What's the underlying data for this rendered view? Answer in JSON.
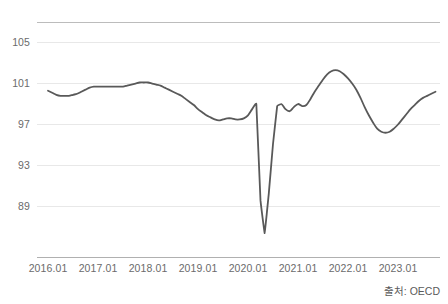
{
  "source_note": "출처: OECD",
  "chart_data": {
    "type": "line",
    "title": "",
    "subtitle": "",
    "xlabel": "",
    "ylabel": "",
    "grid": true,
    "legend": "none",
    "legend_entries": [],
    "line_color": "#595959",
    "gridline_color": "#e8e8e8",
    "axis_color": "#b0b0b0",
    "ylim": [
      85.2,
      106.9
    ],
    "yticks": [
      89,
      93,
      97,
      101,
      105
    ],
    "ytick_labels": [
      "89",
      "93",
      "97",
      "101",
      "105"
    ],
    "xtick_labels": [
      "2016.01",
      "2017.01",
      "2018.01",
      "2019.01",
      "2020.01",
      "2021.01",
      "2022.01",
      "2023.01"
    ],
    "xticks": [
      0,
      12,
      24,
      36,
      48,
      60,
      72,
      84
    ],
    "xlim": [
      0,
      94
    ],
    "x": [
      "2016.01",
      "2016.02",
      "2016.03",
      "2016.04",
      "2016.05",
      "2016.06",
      "2016.07",
      "2016.08",
      "2016.09",
      "2016.10",
      "2016.11",
      "2016.12",
      "2017.01",
      "2017.02",
      "2017.03",
      "2017.04",
      "2017.05",
      "2017.06",
      "2017.07",
      "2017.08",
      "2017.09",
      "2017.10",
      "2017.11",
      "2017.12",
      "2018.01",
      "2018.02",
      "2018.03",
      "2018.04",
      "2018.05",
      "2018.06",
      "2018.07",
      "2018.08",
      "2018.09",
      "2018.10",
      "2018.11",
      "2018.12",
      "2019.01",
      "2019.02",
      "2019.03",
      "2019.04",
      "2019.05",
      "2019.06",
      "2019.07",
      "2019.08",
      "2019.09",
      "2019.10",
      "2019.11",
      "2019.12",
      "2020.01",
      "2020.02",
      "2020.03",
      "2020.04",
      "2020.05",
      "2020.06",
      "2020.07",
      "2020.08",
      "2020.09",
      "2020.10",
      "2020.11",
      "2020.12",
      "2021.01",
      "2021.02",
      "2021.03",
      "2021.04",
      "2021.05",
      "2021.06",
      "2021.07",
      "2021.08",
      "2021.09",
      "2021.10",
      "2021.11",
      "2021.12",
      "2022.01",
      "2022.02",
      "2022.03",
      "2022.04",
      "2022.05",
      "2022.06",
      "2022.07",
      "2022.08",
      "2022.09",
      "2022.10",
      "2022.11",
      "2022.12",
      "2023.01",
      "2023.02",
      "2023.03",
      "2023.04",
      "2023.05",
      "2023.06",
      "2023.07",
      "2023.08",
      "2023.09",
      "2023.10"
    ],
    "values": [
      100.2,
      100.0,
      99.8,
      99.7,
      99.7,
      99.7,
      99.8,
      99.9,
      100.1,
      100.3,
      100.5,
      100.6,
      100.6,
      100.6,
      100.6,
      100.6,
      100.6,
      100.6,
      100.6,
      100.7,
      100.8,
      100.9,
      101.0,
      101.0,
      101.0,
      100.9,
      100.8,
      100.7,
      100.5,
      100.3,
      100.1,
      99.9,
      99.7,
      99.4,
      99.1,
      98.8,
      98.4,
      98.1,
      97.8,
      97.6,
      97.4,
      97.3,
      97.4,
      97.5,
      97.5,
      97.4,
      97.4,
      97.5,
      97.8,
      98.4,
      98.9,
      89.5,
      86.3,
      90.2,
      95.0,
      98.7,
      98.9,
      98.4,
      98.2,
      98.6,
      98.9,
      98.7,
      98.8,
      99.4,
      100.1,
      100.7,
      101.3,
      101.8,
      102.1,
      102.2,
      102.1,
      101.8,
      101.4,
      100.9,
      100.3,
      99.5,
      98.6,
      97.8,
      97.1,
      96.5,
      96.2,
      96.1,
      96.2,
      96.5,
      96.9,
      97.4,
      97.9,
      98.4,
      98.8,
      99.2,
      99.5,
      99.7,
      99.9,
      100.1
    ]
  }
}
